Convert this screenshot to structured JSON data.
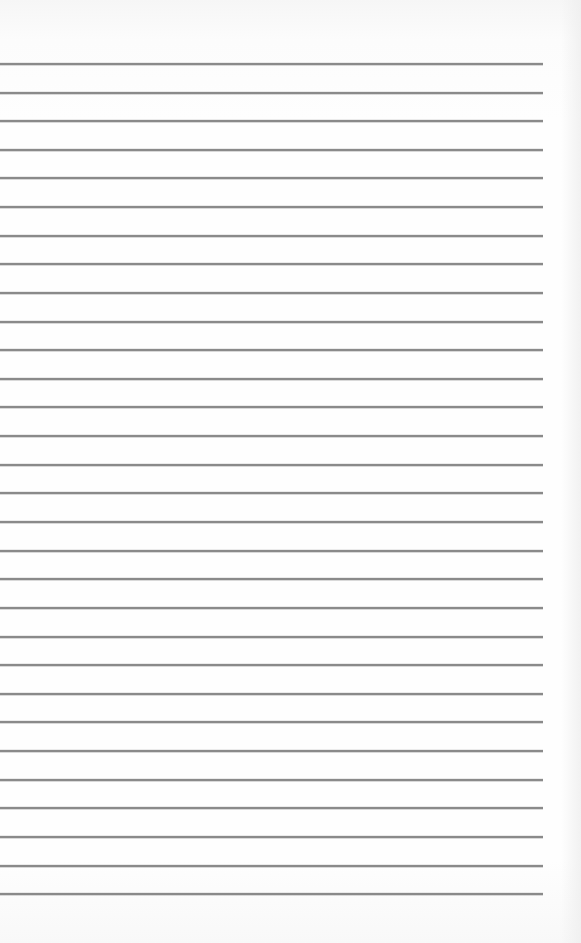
{
  "page": {
    "type": "blank lined paper",
    "rule_count": 30,
    "rule_color": "#8a8a8a",
    "background_color": "#fdfdfd",
    "rule_start_x": 0,
    "rule_end_x": 543,
    "rule_thickness": 2,
    "rule_positions_y": [
      64,
      93,
      121,
      150,
      178,
      207,
      236,
      264,
      293,
      322,
      350,
      379,
      407,
      436,
      465,
      493,
      522,
      551,
      579,
      608,
      637,
      665,
      694,
      722,
      751,
      780,
      808,
      837,
      866,
      894
    ]
  }
}
